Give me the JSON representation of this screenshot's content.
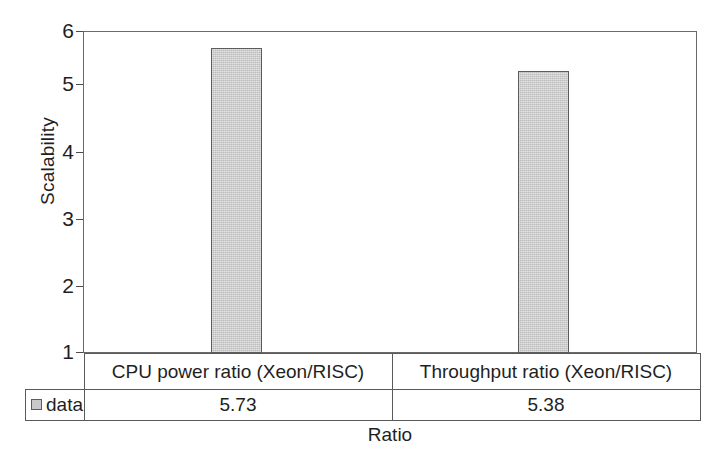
{
  "chart_data": {
    "type": "bar",
    "title": "",
    "xlabel": "Ratio",
    "ylabel": "Scalability",
    "categories": [
      "CPU power ratio (Xeon/RISC)",
      "Throughput ratio (Xeon/RISC)"
    ],
    "values": [
      5.73,
      5.38
    ],
    "value_labels": [
      "5.73",
      "5.38"
    ],
    "series": [
      {
        "name": "data",
        "values": [
          5.73,
          5.38
        ]
      }
    ],
    "legend": [
      "data"
    ],
    "legend_position": "bottom-left-table",
    "ylim": [
      1,
      6
    ],
    "yticks": [
      1,
      2,
      3,
      4,
      5,
      6
    ],
    "ytick_labels": [
      "1",
      "2",
      "3",
      "4",
      "5",
      "6"
    ],
    "grid": false,
    "bar_fill_color": "#c9c9c9",
    "bar_edge_color": "#5c5c5c",
    "axis_color": "#6a6a6a",
    "text_color": "#1f1f1f"
  },
  "table": {
    "legend_label": "data",
    "columns": [
      "CPU power ratio (Xeon/RISC)",
      "Throughput ratio (Xeon/RISC)"
    ],
    "values": [
      "5.73",
      "5.38"
    ]
  },
  "axes": {
    "y_title": "Scalability",
    "x_title": "Ratio",
    "y_ticks": [
      "6",
      "5",
      "4",
      "3",
      "2",
      "1"
    ]
  }
}
